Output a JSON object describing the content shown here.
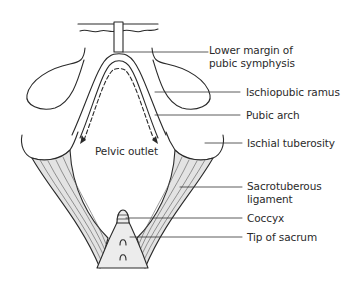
{
  "diagram": {
    "title": "Pelvic outlet",
    "center_label": "Pelvic outlet",
    "labels": [
      {
        "id": "lower-margin-pubic-symphysis",
        "line1": "Lower margin of",
        "line2": "pubic symphysis"
      },
      {
        "id": "ischiopubic-ramus",
        "line1": "Ischiopubic ramus"
      },
      {
        "id": "pubic-arch",
        "line1": "Pubic arch"
      },
      {
        "id": "ischial-tuberosity",
        "line1": "Ischial tuberosity"
      },
      {
        "id": "sacrotuberous-ligament",
        "line1": "Sacrotuberous",
        "line2": "ligament"
      },
      {
        "id": "coccyx",
        "line1": "Coccyx"
      },
      {
        "id": "tip-of-sacrum",
        "line1": "Tip of sacrum"
      }
    ],
    "colors": {
      "stroke": "#2a2a2a",
      "ligament_fill": "#e3e3e3",
      "sacrum_fill": "#ececec",
      "leader": "#333333"
    }
  }
}
